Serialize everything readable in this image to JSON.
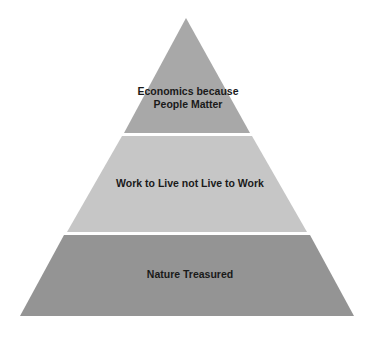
{
  "diagram": {
    "type": "pyramid",
    "tiers": [
      {
        "position": "top",
        "label": "Economics because People Matter",
        "color": "#a8a8a8"
      },
      {
        "position": "middle",
        "label": "Work to Live not Live to Work",
        "color": "#c6c6c6"
      },
      {
        "position": "bottom",
        "label": "Nature Treasured",
        "color": "#949494"
      }
    ],
    "background": "#ffffff"
  }
}
